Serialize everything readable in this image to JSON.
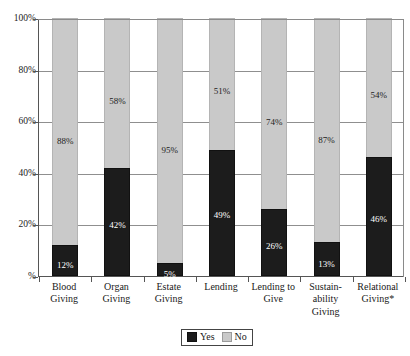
{
  "chart_data": {
    "type": "bar",
    "title": "",
    "subtitle": "",
    "xlabel": "",
    "ylabel": "",
    "ylim": [
      0,
      100
    ],
    "grid": true,
    "stacked": true,
    "stack_total": 100,
    "legend_position": "bottom-center",
    "categories": [
      "Blood Giving",
      "Organ Giving",
      "Estate Giving",
      "Lending",
      "Lending to Give",
      "Sustain- ability Giving",
      "Relational Giving*"
    ],
    "category_lines": [
      [
        "Blood",
        "Giving"
      ],
      [
        "Organ",
        "Giving"
      ],
      [
        "Estate",
        "Giving"
      ],
      [
        "Lending"
      ],
      [
        "Lending to",
        "Give"
      ],
      [
        "Sustain-",
        "ability",
        "Giving"
      ],
      [
        "Relational",
        "Giving*"
      ]
    ],
    "series": [
      {
        "name": "Yes",
        "color": "#1c1c1c",
        "values": [
          12,
          42,
          5,
          49,
          26,
          13,
          46
        ],
        "labels": [
          "12%",
          "42%",
          "5%",
          "49%",
          "26%",
          "13%",
          "46%"
        ]
      },
      {
        "name": "No",
        "color": "#c9c9c9",
        "values": [
          88,
          58,
          95,
          51,
          74,
          87,
          54
        ],
        "labels": [
          "88%",
          "58%",
          "95%",
          "51%",
          "74%",
          "87%",
          "54%"
        ]
      }
    ],
    "yaxis": {
      "ticks": [
        0,
        20,
        40,
        60,
        80,
        100
      ],
      "tick_labels": [
        "%",
        "20%",
        "40%",
        "60%",
        "80%",
        "100%"
      ]
    }
  },
  "legend": {
    "items": [
      {
        "label": "Yes",
        "swatch": "black-square-swatch"
      },
      {
        "label": "No",
        "swatch": "gray-square-swatch"
      }
    ]
  }
}
